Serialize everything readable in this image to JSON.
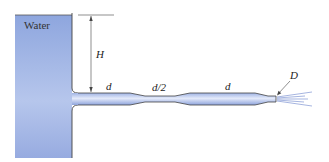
{
  "diagram": {
    "tank_label": "Water",
    "labels": {
      "height": "H",
      "pipe1_diameter": "d",
      "pipe2_diameter": "d/2",
      "pipe3_diameter": "d",
      "nozzle_diameter": "D"
    },
    "colors": {
      "water_light": "#e6ecf8",
      "water_dark": "#8ea4dc",
      "outline": "#444444"
    }
  }
}
